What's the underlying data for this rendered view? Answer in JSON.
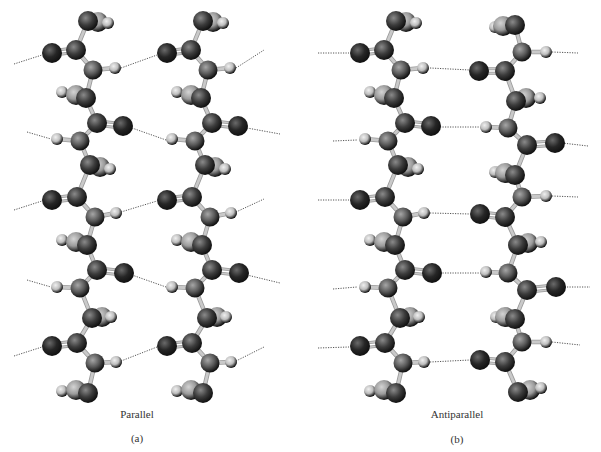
{
  "figure": {
    "panels": [
      {
        "id": "a",
        "title": "Parallel",
        "tag": "(a)",
        "title_pos": [
          137,
          408
        ],
        "tag_pos": [
          137,
          432
        ],
        "strands": [
          {
            "dx": 0,
            "template": "down"
          },
          {
            "dx": 115,
            "template": "down"
          }
        ],
        "hbonds": [
          [
            14,
            64,
            42,
            55
          ],
          [
            121,
            68,
            157,
            55
          ],
          [
            236,
            68,
            264,
            50
          ],
          [
            27,
            132,
            51,
            139
          ],
          [
            132,
            128,
            166,
            140
          ],
          [
            247,
            128,
            280,
            134
          ],
          [
            14,
            210,
            42,
            201
          ],
          [
            121,
            212,
            157,
            201
          ],
          [
            236,
            212,
            264,
            199
          ],
          [
            27,
            280,
            51,
            287
          ],
          [
            132,
            275,
            166,
            287
          ],
          [
            247,
            275,
            280,
            283
          ],
          [
            14,
            356,
            42,
            347
          ],
          [
            121,
            361,
            157,
            347
          ],
          [
            236,
            361,
            264,
            347
          ]
        ]
      },
      {
        "id": "b",
        "title": "Antiparallel",
        "tag": "(b)",
        "title_pos": [
          457,
          408
        ],
        "tag_pos": [
          457,
          433
        ],
        "strands": [
          {
            "dx": 308,
            "template": "down"
          },
          {
            "dx": 0,
            "template": "up"
          }
        ],
        "hbonds": [
          [
            318,
            53,
            349,
            53
          ],
          [
            430,
            68,
            470,
            70
          ],
          [
            552,
            52,
            578,
            53
          ],
          [
            333,
            141,
            357,
            140
          ],
          [
            440,
            127,
            481,
            127
          ],
          [
            562,
            143,
            588,
            146
          ],
          [
            318,
            200,
            349,
            200
          ],
          [
            430,
            213,
            470,
            214
          ],
          [
            552,
            196,
            578,
            197
          ],
          [
            333,
            289,
            357,
            287
          ],
          [
            440,
            273,
            481,
            273
          ],
          [
            562,
            287,
            590,
            287
          ],
          [
            318,
            348,
            349,
            347
          ],
          [
            430,
            362,
            470,
            360
          ],
          [
            552,
            342,
            580,
            345
          ]
        ]
      }
    ]
  },
  "atom_styles": {
    "C": {
      "fill": "#3c3c3c",
      "hi": "#8a8a8a",
      "r": 10
    },
    "O": {
      "fill": "#262626",
      "hi": "#6a6a6a",
      "r": 10
    },
    "N": {
      "fill": "#5a5a5a",
      "hi": "#a6a6a6",
      "r": 9.5
    },
    "H": {
      "fill": "#bdbdbd",
      "hi": "#f0f0f0",
      "r": 6
    },
    "R": {
      "fill": "#9a9a9a",
      "hi": "#d4d4d4",
      "r": 10
    }
  },
  "colors": {
    "bond": "#c9c9c9",
    "bond_edge": "#9a9a9a",
    "hbond": "#555555",
    "text": "#333333"
  },
  "templates": {
    "down": {
      "atoms": [
        [
          "R",
          98,
          22
        ],
        [
          "C",
          88,
          21
        ],
        [
          "H",
          108,
          23
        ],
        [
          "O",
          52,
          53
        ],
        [
          "C",
          76,
          50
        ],
        [
          "N",
          93,
          70
        ],
        [
          "H",
          115,
          68
        ],
        [
          "H",
          62,
          92
        ],
        [
          "R",
          76,
          95
        ],
        [
          "C",
          86,
          98
        ],
        [
          "C",
          97,
          123
        ],
        [
          "O",
          123,
          126
        ],
        [
          "N",
          80,
          141
        ],
        [
          "H",
          57,
          139
        ],
        [
          "R",
          100,
          167
        ],
        [
          "C",
          90,
          165
        ],
        [
          "H",
          110,
          169
        ],
        [
          "O",
          52,
          200
        ],
        [
          "C",
          77,
          197
        ],
        [
          "N",
          95,
          217
        ],
        [
          "H",
          116,
          213
        ],
        [
          "H",
          62,
          240
        ],
        [
          "R",
          76,
          242
        ],
        [
          "C",
          87,
          245
        ],
        [
          "C",
          97,
          270
        ],
        [
          "O",
          124,
          273
        ],
        [
          "N",
          80,
          288
        ],
        [
          "H",
          57,
          287
        ],
        [
          "R",
          102,
          317
        ],
        [
          "C",
          92,
          318
        ],
        [
          "H",
          111,
          317
        ],
        [
          "O",
          52,
          346
        ],
        [
          "C",
          77,
          343
        ],
        [
          "N",
          95,
          363
        ],
        [
          "H",
          116,
          362
        ],
        [
          "H",
          62,
          391
        ],
        [
          "R",
          76,
          390
        ],
        [
          "C",
          88,
          393
        ]
      ],
      "bonds": [
        [
          88,
          21,
          76,
          50,
          1
        ],
        [
          76,
          50,
          52,
          53,
          2
        ],
        [
          76,
          50,
          93,
          70,
          1
        ],
        [
          93,
          70,
          115,
          68,
          1
        ],
        [
          93,
          70,
          86,
          98,
          1
        ],
        [
          86,
          98,
          97,
          123,
          1
        ],
        [
          97,
          123,
          123,
          126,
          2
        ],
        [
          97,
          123,
          80,
          141,
          1
        ],
        [
          80,
          141,
          57,
          139,
          1
        ],
        [
          80,
          141,
          90,
          165,
          1
        ],
        [
          90,
          165,
          77,
          197,
          1
        ],
        [
          77,
          197,
          52,
          200,
          2
        ],
        [
          77,
          197,
          95,
          217,
          1
        ],
        [
          95,
          217,
          116,
          213,
          1
        ],
        [
          95,
          217,
          87,
          245,
          1
        ],
        [
          87,
          245,
          97,
          270,
          1
        ],
        [
          97,
          270,
          124,
          273,
          2
        ],
        [
          97,
          270,
          80,
          288,
          1
        ],
        [
          80,
          288,
          57,
          287,
          1
        ],
        [
          80,
          288,
          92,
          318,
          1
        ],
        [
          92,
          318,
          77,
          343,
          1
        ],
        [
          77,
          343,
          52,
          346,
          2
        ],
        [
          77,
          343,
          95,
          363,
          1
        ],
        [
          95,
          363,
          116,
          362,
          1
        ],
        [
          95,
          363,
          88,
          393,
          1
        ]
      ]
    },
    "up": {
      "atoms": [
        [
          "H",
          495,
          27
        ],
        [
          "R",
          503,
          26
        ],
        [
          "C",
          515,
          25
        ],
        [
          "N",
          522,
          52
        ],
        [
          "H",
          546,
          52
        ],
        [
          "O",
          479,
          71
        ],
        [
          "C",
          505,
          71
        ],
        [
          "R",
          526,
          98
        ],
        [
          "C",
          516,
          101
        ],
        [
          "H",
          540,
          98
        ],
        [
          "N",
          508,
          128
        ],
        [
          "H",
          486,
          127
        ],
        [
          "C",
          527,
          145
        ],
        [
          "O",
          555,
          143
        ],
        [
          "H",
          495,
          172
        ],
        [
          "R",
          505,
          173
        ],
        [
          "C",
          515,
          175
        ],
        [
          "N",
          522,
          197
        ],
        [
          "H",
          546,
          196
        ],
        [
          "O",
          480,
          214
        ],
        [
          "C",
          505,
          217
        ],
        [
          "R",
          528,
          243
        ],
        [
          "C",
          518,
          245
        ],
        [
          "H",
          541,
          242
        ],
        [
          "N",
          508,
          273
        ],
        [
          "H",
          486,
          272
        ],
        [
          "C",
          527,
          290
        ],
        [
          "O",
          556,
          287
        ],
        [
          "H",
          496,
          317
        ],
        [
          "R",
          505,
          317
        ],
        [
          "C",
          515,
          319
        ],
        [
          "N",
          522,
          342
        ],
        [
          "H",
          546,
          342
        ],
        [
          "O",
          480,
          360
        ],
        [
          "C",
          505,
          362
        ],
        [
          "R",
          530,
          390
        ],
        [
          "C",
          518,
          392
        ],
        [
          "H",
          541,
          388
        ]
      ],
      "bonds": [
        [
          515,
          25,
          522,
          52,
          1
        ],
        [
          522,
          52,
          546,
          52,
          1
        ],
        [
          522,
          52,
          505,
          71,
          1
        ],
        [
          505,
          71,
          479,
          71,
          2
        ],
        [
          505,
          71,
          516,
          101,
          1
        ],
        [
          516,
          101,
          508,
          128,
          1
        ],
        [
          508,
          128,
          486,
          127,
          1
        ],
        [
          508,
          128,
          527,
          145,
          1
        ],
        [
          527,
          145,
          555,
          143,
          2
        ],
        [
          527,
          145,
          515,
          175,
          1
        ],
        [
          515,
          175,
          522,
          197,
          1
        ],
        [
          522,
          197,
          546,
          196,
          1
        ],
        [
          522,
          197,
          505,
          217,
          1
        ],
        [
          505,
          217,
          480,
          214,
          2
        ],
        [
          505,
          217,
          518,
          245,
          1
        ],
        [
          518,
          245,
          508,
          273,
          1
        ],
        [
          508,
          273,
          486,
          272,
          1
        ],
        [
          508,
          273,
          527,
          290,
          1
        ],
        [
          527,
          290,
          556,
          287,
          2
        ],
        [
          527,
          290,
          515,
          319,
          1
        ],
        [
          515,
          319,
          522,
          342,
          1
        ],
        [
          522,
          342,
          546,
          342,
          1
        ],
        [
          522,
          342,
          505,
          362,
          1
        ],
        [
          505,
          362,
          480,
          360,
          2
        ],
        [
          505,
          362,
          518,
          392,
          1
        ]
      ]
    }
  }
}
